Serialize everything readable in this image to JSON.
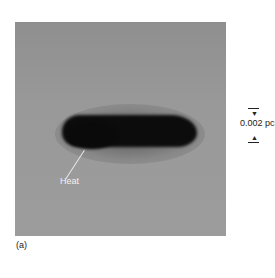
{
  "figure": {
    "annotation": "Heat",
    "scale_bar_label": "0.002 pc",
    "panel_label": "(a)",
    "icons": {
      "scale_arrow_down": "▼",
      "scale_arrow_up": "▲"
    }
  }
}
